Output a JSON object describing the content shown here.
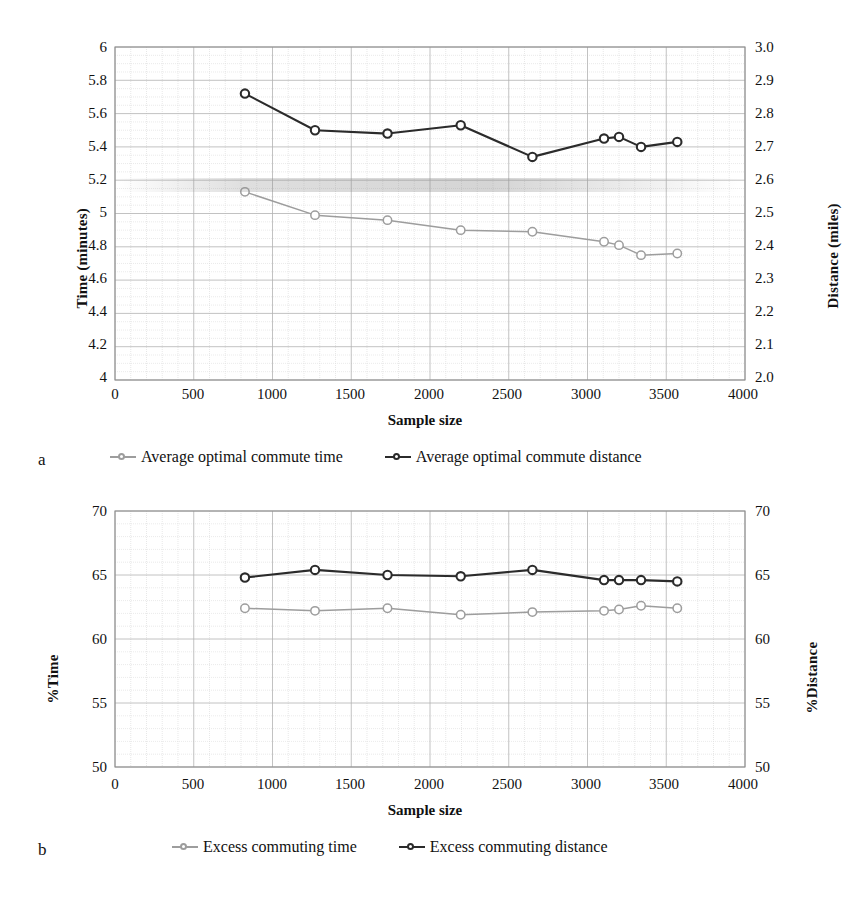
{
  "figure": {
    "panels": [
      {
        "letter": "a",
        "axis": {
          "x_label": "Sample size",
          "y_left_label": "Time (minutes)",
          "y_right_label": "Distance (miles)",
          "x_ticks": [
            "0",
            "500",
            "1000",
            "1500",
            "2000",
            "2500",
            "3000",
            "3500",
            "4000"
          ],
          "y_left_ticks": [
            "6",
            "5.8",
            "5.6",
            "5.4",
            "5.2",
            "5",
            "4.8",
            "4.6",
            "4.4",
            "4.2",
            "4"
          ],
          "y_right_ticks": [
            "3.0",
            "2.9",
            "2.8",
            "2.7",
            "2.6",
            "2.5",
            "2.4",
            "2.3",
            "2.2",
            "2.1",
            "2.0"
          ]
        },
        "legend": [
          {
            "label": "Average optimal commute time",
            "color": "#9d9d9d"
          },
          {
            "label": "Average optimal commute distance",
            "color": "#2b2b2b"
          }
        ]
      },
      {
        "letter": "b",
        "axis": {
          "x_label": "Sample size",
          "y_left_label": "%Time",
          "y_right_label": "%Distance",
          "x_ticks": [
            "0",
            "500",
            "1000",
            "1500",
            "2000",
            "2500",
            "3000",
            "3500",
            "4000"
          ],
          "y_left_ticks": [
            "70",
            "65",
            "60",
            "55",
            "50"
          ],
          "y_right_ticks": [
            "70",
            "65",
            "60",
            "55",
            "50"
          ]
        },
        "legend": [
          {
            "label": "Excess commuting time",
            "color": "#9d9d9d"
          },
          {
            "label": "Excess commuting distance",
            "color": "#2b2b2b"
          }
        ]
      }
    ]
  },
  "chart_data": [
    {
      "type": "line",
      "title": "",
      "panel": "a",
      "xlabel": "Sample size",
      "ylabel": "Time (minutes)",
      "y2label": "Distance (miles)",
      "xlim": [
        0,
        4000
      ],
      "ylim": [
        4,
        6
      ],
      "y2lim": [
        2.0,
        3.0
      ],
      "grid": true,
      "legend_position": "below",
      "x": [
        825,
        1270,
        1730,
        2195,
        2650,
        3105,
        3200,
        3340,
        3570
      ],
      "series": [
        {
          "name": "Average optimal commute time",
          "axis": "left",
          "units": "minutes",
          "color": "#9d9d9d",
          "values": [
            5.13,
            4.99,
            4.96,
            4.9,
            4.89,
            4.83,
            4.81,
            4.75,
            4.76
          ]
        },
        {
          "name": "Average optimal commute distance",
          "axis": "right",
          "units": "miles",
          "color": "#2b2b2b",
          "values": [
            2.86,
            2.75,
            2.74,
            2.765,
            2.67,
            2.725,
            2.73,
            2.7,
            2.715
          ]
        }
      ]
    },
    {
      "type": "line",
      "title": "",
      "panel": "b",
      "xlabel": "Sample size",
      "ylabel": "%Time",
      "y2label": "%Distance",
      "xlim": [
        0,
        4000
      ],
      "ylim": [
        50,
        70
      ],
      "y2lim": [
        50,
        70
      ],
      "grid": true,
      "legend_position": "below",
      "x": [
        825,
        1270,
        1730,
        2195,
        2650,
        3105,
        3200,
        3340,
        3570
      ],
      "series": [
        {
          "name": "Excess commuting time",
          "axis": "left",
          "units": "%",
          "color": "#9d9d9d",
          "values": [
            62.4,
            62.2,
            62.4,
            61.9,
            62.1,
            62.2,
            62.3,
            62.6,
            62.4
          ]
        },
        {
          "name": "Excess commuting distance",
          "axis": "right",
          "units": "%",
          "color": "#2b2b2b",
          "values": [
            64.8,
            65.4,
            65.0,
            64.9,
            65.4,
            64.6,
            64.6,
            64.6,
            64.5
          ]
        }
      ]
    }
  ]
}
